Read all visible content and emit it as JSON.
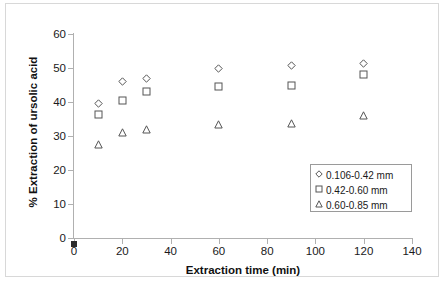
{
  "chart_data": {
    "type": "scatter",
    "title": "",
    "xlabel": "Extraction time (min)",
    "ylabel": "% Extraction of ursolic acid",
    "xlim": [
      0,
      140
    ],
    "ylim": [
      0,
      60
    ],
    "xticks": [
      0,
      20,
      40,
      60,
      80,
      100,
      120,
      140
    ],
    "yticks": [
      0,
      10,
      20,
      30,
      40,
      50,
      60
    ],
    "grid": false,
    "legend_position": "lower-right",
    "x": [
      10,
      20,
      30,
      60,
      90,
      120
    ],
    "series": [
      {
        "name": "0.106-0.42 mm",
        "marker": "diamond",
        "values": [
          39.7,
          46.0,
          46.8,
          50.0,
          50.8,
          51.3
        ]
      },
      {
        "name": "0.42-0.60 mm",
        "marker": "square",
        "values": [
          36.2,
          40.5,
          43.0,
          44.7,
          44.9,
          48.2
        ]
      },
      {
        "name": "0.60-0.85 mm",
        "marker": "triangle",
        "values": [
          27.5,
          31.0,
          31.8,
          33.3,
          33.8,
          35.9
        ]
      }
    ]
  },
  "axes": {
    "x_tick_labels": [
      "0",
      "20",
      "40",
      "60",
      "80",
      "100",
      "120",
      "140"
    ],
    "y_tick_labels": [
      "0",
      "10",
      "20",
      "30",
      "40",
      "50",
      "60"
    ],
    "x_title": "Extraction time (min)",
    "y_title": "% Extraction of ursolic acid"
  },
  "legend": {
    "entries": [
      {
        "label": "0.106-0.42 mm",
        "marker": "diamond"
      },
      {
        "label": "0.42-0.60 mm",
        "marker": "square"
      },
      {
        "label": "0.60-0.85 mm",
        "marker": "triangle"
      }
    ]
  },
  "colors": {
    "marker_stroke": "#555555",
    "axis": "#b0b0b0",
    "text": "#1a1a1a",
    "background": "#ffffff",
    "frame": "#d8d8d8"
  }
}
